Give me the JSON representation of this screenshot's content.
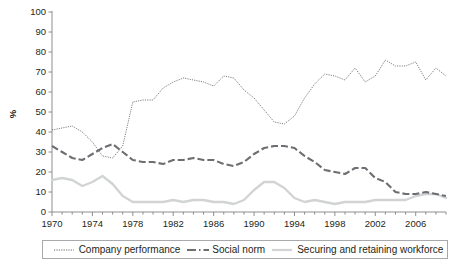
{
  "chart_data": {
    "type": "line",
    "title": "",
    "subtitle": "",
    "xlabel": "",
    "ylabel": "%",
    "xlim": [
      1970,
      2009
    ],
    "ylim": [
      0,
      100
    ],
    "yticks": [
      0,
      10,
      20,
      30,
      40,
      50,
      60,
      70,
      80,
      90,
      100
    ],
    "ytick_labels": [
      "0",
      "10",
      "20",
      "30",
      "40",
      "50",
      "60",
      "70",
      "80",
      "90",
      "100"
    ],
    "xticks": [
      1970,
      1974,
      1978,
      1982,
      1986,
      1990,
      1994,
      1998,
      2002,
      2006
    ],
    "xtick_labels": [
      "1970",
      "1974",
      "1978",
      "1982",
      "1986",
      "1990",
      "1994",
      "1998",
      "2002",
      "2006"
    ],
    "minor_xtick_interval": 1,
    "grid": false,
    "legend_position": "bottom",
    "x": [
      1970,
      1971,
      1972,
      1973,
      1974,
      1975,
      1976,
      1977,
      1978,
      1979,
      1980,
      1981,
      1982,
      1983,
      1984,
      1985,
      1986,
      1987,
      1988,
      1989,
      1990,
      1991,
      1992,
      1993,
      1994,
      1995,
      1996,
      1997,
      1998,
      1999,
      2000,
      2001,
      2002,
      2003,
      2004,
      2005,
      2006,
      2007,
      2008,
      2009
    ],
    "series": [
      {
        "name": "Company performance",
        "style": "dotted-thin",
        "color": "#58595b",
        "values": [
          41,
          42,
          43,
          40,
          35,
          28,
          27,
          33,
          55,
          56,
          56,
          62,
          65,
          67,
          66,
          65,
          63,
          68,
          67,
          61,
          57,
          51,
          45,
          44,
          48,
          57,
          64,
          69,
          68,
          66,
          72,
          65,
          68,
          76,
          73,
          73,
          75,
          66,
          72,
          68
        ]
      },
      {
        "name": "Social norm",
        "style": "dashed-thick",
        "color": "#6d6e71",
        "values": [
          33,
          30,
          27,
          26,
          29,
          32,
          34,
          30,
          26,
          25,
          25,
          24,
          26,
          26,
          27,
          26,
          26,
          24,
          23,
          25,
          29,
          32,
          33,
          33,
          32,
          28,
          25,
          21,
          20,
          19,
          22,
          22,
          17,
          15,
          10,
          9,
          9,
          10,
          9,
          8
        ]
      },
      {
        "name": "Securing and retaining workforce",
        "style": "solid-light",
        "color": "#d1d3d4",
        "values": [
          16,
          17,
          16,
          13,
          15,
          18,
          14,
          8,
          5,
          5,
          5,
          5,
          6,
          5,
          6,
          6,
          5,
          5,
          4,
          6,
          11,
          15,
          15,
          12,
          7,
          5,
          6,
          5,
          4,
          5,
          5,
          5,
          6,
          6,
          6,
          6,
          8,
          9,
          9,
          7
        ]
      }
    ]
  },
  "legend": {
    "items": [
      {
        "label": "Company performance",
        "swatch": "dotted-thin-swatch"
      },
      {
        "label": "Social norm",
        "swatch": "dashed-thick-swatch"
      },
      {
        "label": "Securing and retaining workforce",
        "swatch": "solid-light-swatch"
      }
    ]
  },
  "colors": {
    "company_performance": "#58595b",
    "social_norm": "#6d6e71",
    "securing_workforce": "#d1d3d4",
    "axis": "#808285",
    "text": "#231f20",
    "legend_border": "#a7a9ac"
  }
}
